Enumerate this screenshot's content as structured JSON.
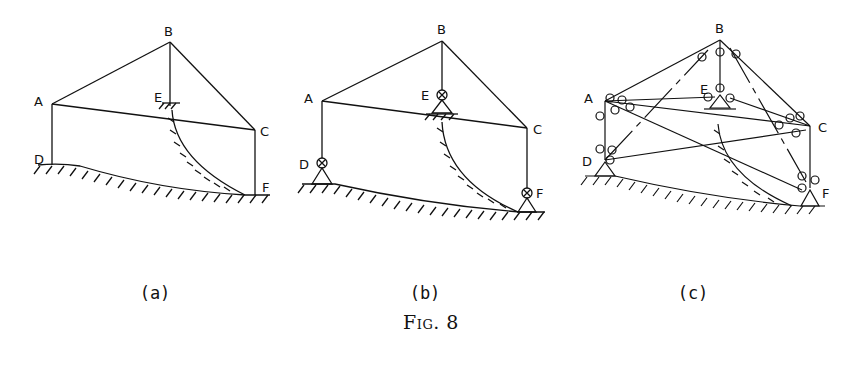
{
  "figure": {
    "caption": "Fig. 8",
    "panels": [
      {
        "id": "a",
        "label": "(a)",
        "nodes": {
          "A": "A",
          "B": "B",
          "C": "C",
          "D": "D",
          "E": "E",
          "F": "F"
        },
        "description": "Structure ABC with members AB, BC, AC, AD, BE, CF resting on curved ground; E and F fixed to hatched surfaces"
      },
      {
        "id": "b",
        "label": "(b)",
        "nodes": {
          "A": "A",
          "B": "B",
          "C": "C",
          "D": "D",
          "E": "E",
          "F": "F"
        },
        "description": "Same structure with pinned supports at D, E, F (circled-x hinges on triangular supports)"
      },
      {
        "id": "c",
        "label": "(c)",
        "nodes": {
          "A": "A",
          "B": "B",
          "C": "C",
          "D": "D",
          "E": "E",
          "F": "F"
        },
        "description": "Fully braced space frame with hinged members connecting A, B, C, D, E, F"
      }
    ]
  }
}
